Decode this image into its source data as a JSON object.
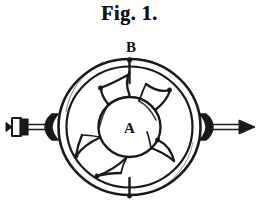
{
  "figure": {
    "caption": "Fig. 1.",
    "labels": {
      "hub": "A",
      "casing_top": "B"
    },
    "colors": {
      "ink": "#1c1815",
      "paper": "#ffffff"
    },
    "parts": {
      "outer_casing_ring": "outer-casing-ring",
      "inner_casing_ring": "inner-casing-ring",
      "hub_circle": "hub-circle",
      "vane_count": 5,
      "inlet_pipe": "inlet-pipe-left",
      "inlet_arrow_direction": "left",
      "outlet_arrow_direction": "right",
      "top_tick": "top-index-tick",
      "bottom_tick": "bottom-index-tick"
    }
  }
}
